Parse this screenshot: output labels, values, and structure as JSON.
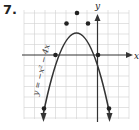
{
  "problem_number": "7.",
  "graph": {
    "equation_label": "y = −x² − 4x",
    "x_axis_label": "x",
    "y_axis_label": "y",
    "points": [
      {
        "x": -5,
        "y": -5
      },
      {
        "x": -4,
        "y": 0
      },
      {
        "x": -3,
        "y": 3
      },
      {
        "x": -2,
        "y": 4
      },
      {
        "x": -1,
        "y": 3
      },
      {
        "x": 0,
        "y": 0
      },
      {
        "x": 1,
        "y": -5
      }
    ],
    "vertex": {
      "x": -2,
      "y": 4
    },
    "colors": {
      "grid": "#d0d0d0",
      "axis": "#333333",
      "curve": "#333333"
    }
  }
}
